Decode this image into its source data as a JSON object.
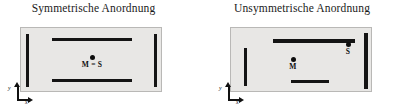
{
  "figure": {
    "caption_language": "de",
    "panels": [
      {
        "id": "symmetric",
        "title": "Symmetrische Anordnung",
        "plate": {
          "x": 20,
          "y": 27,
          "w": 142,
          "h": 65,
          "fill": "#e8e7e5",
          "stroke": "#b9b8b6"
        },
        "bars": [
          {
            "name": "left-vertical-wall",
            "x": 5,
            "y": 6,
            "w": 3.2,
            "h": 53
          },
          {
            "name": "right-vertical-wall",
            "x": 133,
            "y": 6,
            "w": 3.2,
            "h": 53
          },
          {
            "name": "top-horizontal-wall",
            "x": 31,
            "y": 10,
            "w": 80,
            "h": 3.2
          },
          {
            "name": "bottom-horizontal-wall",
            "x": 31,
            "y": 51,
            "w": 80,
            "h": 3.2
          }
        ],
        "points": [
          {
            "name": "center-of-mass-and-shear-center",
            "label": "M = S",
            "x": 71,
            "y": 29
          }
        ],
        "axis": {
          "x": 8,
          "y": 82,
          "x_label": "x",
          "y_label": "y"
        }
      },
      {
        "id": "unsymmetric",
        "title": "Unsymmetrische Anordnung",
        "plate": {
          "x": 31,
          "y": 27,
          "w": 142,
          "h": 65,
          "fill": "#e8e7e5",
          "stroke": "#b9b8b6"
        },
        "bars": [
          {
            "name": "left-vertical-wall",
            "x": 13,
            "y": 20,
            "w": 3.2,
            "h": 38
          },
          {
            "name": "right-vertical-wall",
            "x": 133,
            "y": 5,
            "w": 3.6,
            "h": 56
          },
          {
            "name": "top-horizontal-wall",
            "x": 42,
            "y": 11,
            "w": 82,
            "h": 3.6
          },
          {
            "name": "bottom-horizontal-wall",
            "x": 60,
            "y": 52,
            "w": 38,
            "h": 3.2
          }
        ],
        "points": [
          {
            "name": "center-of-mass",
            "label": "M",
            "x": 62,
            "y": 31
          },
          {
            "name": "shear-center",
            "label": "S",
            "x": 117,
            "y": 16
          }
        ],
        "axis": {
          "x": 219,
          "y": 82,
          "x_label": "x",
          "y_label": "y"
        }
      }
    ],
    "colors": {
      "bar": "#141414",
      "plate_fill": "#e8e7e5",
      "plate_stroke": "#b9b8b6",
      "text": "#1a1a1a",
      "background": "#ffffff"
    }
  }
}
